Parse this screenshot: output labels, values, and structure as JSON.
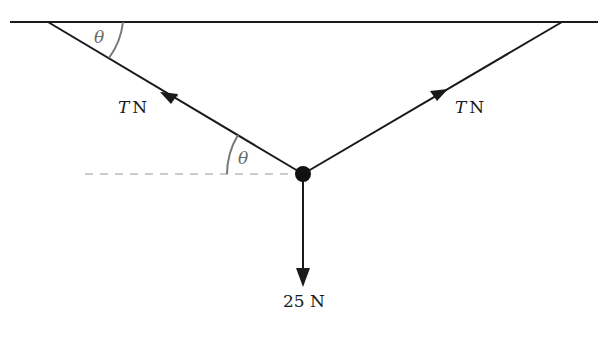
{
  "diagram": {
    "type": "force-diagram",
    "ceiling": {
      "label": ""
    },
    "forces": [
      {
        "id": "tension-left",
        "symbol": "T",
        "unit": "N",
        "direction": "up-left along string"
      },
      {
        "id": "tension-right",
        "symbol": "T",
        "unit": "N",
        "direction": "up-right along string"
      },
      {
        "id": "weight",
        "magnitude": "25",
        "unit": "N",
        "direction": "down"
      }
    ],
    "angles": [
      {
        "id": "angle-ceiling",
        "symbol": "θ",
        "between": "ceiling and left string"
      },
      {
        "id": "angle-horizontal",
        "symbol": "θ",
        "between": "horizontal dashed line and left string"
      }
    ],
    "labels": {
      "left_T": "T",
      "left_N": "N",
      "right_T": "T",
      "right_N": "N",
      "weight": "25 N",
      "theta_top": "θ",
      "theta_bottom": "θ"
    },
    "colors": {
      "lines": "#1a1a1a",
      "angle_arcs": "#777777",
      "dashed": "#bbbbbb"
    }
  }
}
